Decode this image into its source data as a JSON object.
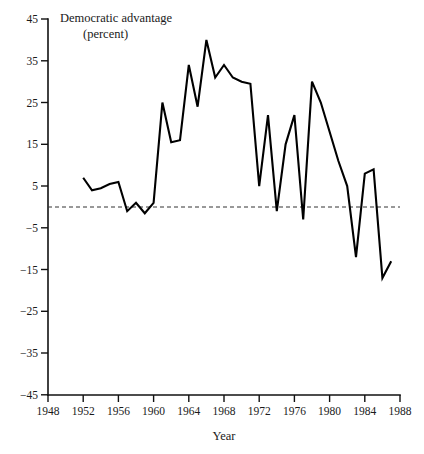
{
  "chart_data": {
    "type": "line",
    "title": "Democratic advantage",
    "subtitle": "(percent)",
    "xlabel": "Year",
    "ylabel": "",
    "xlim": [
      1948,
      1988
    ],
    "ylim": [
      -45,
      45
    ],
    "grid": false,
    "legend_position": "none",
    "zero_reference_line": true,
    "xticks": [
      1948,
      1952,
      1956,
      1960,
      1964,
      1968,
      1972,
      1976,
      1980,
      1984,
      1988
    ],
    "xtick_labels": [
      "1948",
      "1952",
      "1956",
      "1960",
      "1964",
      "1968",
      "1972",
      "1976",
      "1980",
      "1984",
      "1988"
    ],
    "yticks": [
      45,
      35,
      25,
      15,
      5,
      -5,
      -15,
      -25,
      -35,
      -45
    ],
    "ytick_labels": [
      "45",
      "35",
      "25",
      "15",
      "5",
      "−5",
      "−15",
      "−25",
      "−35",
      "−45"
    ],
    "x": [
      1952,
      1953,
      1954,
      1955,
      1956,
      1957,
      1958,
      1959,
      1960,
      1961,
      1962,
      1963,
      1964,
      1965,
      1966,
      1967,
      1968,
      1969,
      1970,
      1971,
      1972,
      1973,
      1974,
      1975,
      1976,
      1977,
      1978,
      1979,
      1980,
      1981,
      1982,
      1983,
      1984,
      1985,
      1986,
      1987
    ],
    "values": [
      7,
      4,
      4.5,
      5.5,
      6,
      -1,
      1,
      -1.5,
      1,
      25,
      15.5,
      16,
      34,
      24,
      40,
      31,
      34,
      31,
      30,
      29.5,
      5,
      22,
      -1,
      15,
      22,
      -3,
      30,
      25,
      18,
      11,
      5,
      -12,
      8,
      9,
      -17,
      -13
    ],
    "series_label": "Democratic advantage",
    "line_color": "#000000",
    "note": "Party identification gap, Democratic minus Republican, 1952-1987"
  },
  "axes": {
    "x_axis_name": "year-axis",
    "y_axis_name": "percent-axis"
  }
}
